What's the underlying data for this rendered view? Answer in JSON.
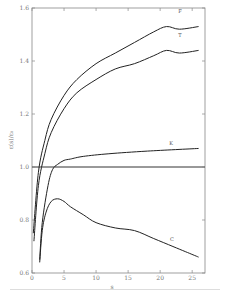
{
  "chart_data": {
    "type": "line",
    "title": "",
    "xlabel": "s",
    "ylabel": "ε(s)/ε₀",
    "xlim": [
      0,
      27
    ],
    "ylim": [
      0.6,
      1.6
    ],
    "xticks": [
      0,
      5,
      10,
      15,
      20,
      25
    ],
    "yticks": [
      0.6,
      0.8,
      1.0,
      1.2,
      1.4,
      1.6
    ],
    "xtick_labels": [
      "0",
      "5",
      "10",
      "15",
      "20",
      "25"
    ],
    "ytick_labels": [
      "0.6",
      "0.8",
      "1.0",
      "1.2",
      "1.4",
      "1.6"
    ],
    "grid": false,
    "reference_line": 1.0,
    "series": [
      {
        "name": "F",
        "x": [
          0.2,
          1,
          2,
          3,
          5,
          7,
          10,
          13,
          16,
          19,
          21,
          23,
          26
        ],
        "values": [
          0.75,
          0.98,
          1.1,
          1.18,
          1.27,
          1.33,
          1.39,
          1.43,
          1.47,
          1.51,
          1.53,
          1.52,
          1.53
        ]
      },
      {
        "name": "T",
        "x": [
          0.3,
          1,
          2,
          3,
          5,
          7,
          10,
          13,
          16,
          19,
          21,
          23,
          26
        ],
        "values": [
          0.72,
          0.93,
          1.05,
          1.13,
          1.22,
          1.28,
          1.33,
          1.37,
          1.39,
          1.42,
          1.44,
          1.43,
          1.44
        ]
      },
      {
        "name": "K",
        "x": [
          1.2,
          1.6,
          2.5,
          3.2,
          4,
          5,
          6,
          8,
          12,
          18,
          26
        ],
        "values": [
          0.65,
          0.79,
          0.93,
          0.99,
          1.01,
          1.025,
          1.03,
          1.04,
          1.05,
          1.06,
          1.07
        ]
      },
      {
        "name": "C",
        "x": [
          1.2,
          1.6,
          2.2,
          3,
          4,
          5,
          6,
          8,
          10,
          13,
          16,
          19,
          22,
          24,
          26
        ],
        "values": [
          0.64,
          0.76,
          0.83,
          0.87,
          0.88,
          0.87,
          0.85,
          0.82,
          0.79,
          0.77,
          0.76,
          0.73,
          0.7,
          0.68,
          0.66
        ]
      }
    ],
    "legend": "inline labels at curve ends (F, T, K, C)"
  },
  "labels": {
    "F": "F",
    "T": "T",
    "K": "K",
    "C": "C",
    "xlabel": "s",
    "ylabel": "ε(s)/ε₀"
  }
}
